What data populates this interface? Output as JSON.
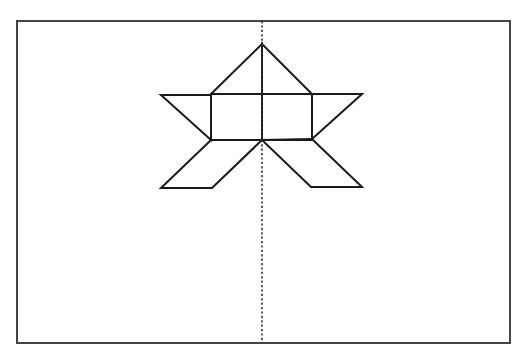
{
  "diagram": {
    "type": "tangram-symmetry-figure",
    "frame": {
      "x1": 17,
      "y1": 21,
      "x2": 510,
      "y2": 343,
      "stroke": "#444444"
    },
    "axis": {
      "x": 262,
      "y1": 21,
      "y2": 343,
      "style": "dotted",
      "stroke": "#333333"
    },
    "stroke_color": "#1a1a1a",
    "shapes": [
      {
        "name": "roof-left-triangle",
        "points": [
          [
            262,
            44
          ],
          [
            211,
            94
          ],
          [
            262,
            94
          ]
        ]
      },
      {
        "name": "roof-right-triangle",
        "points": [
          [
            262,
            44
          ],
          [
            312,
            94
          ],
          [
            262,
            94
          ]
        ]
      },
      {
        "name": "left-square",
        "points": [
          [
            211,
            94
          ],
          [
            262,
            94
          ],
          [
            262,
            140
          ],
          [
            211,
            140
          ]
        ]
      },
      {
        "name": "right-square",
        "points": [
          [
            262,
            94
          ],
          [
            312,
            94
          ],
          [
            312,
            140
          ],
          [
            262,
            140
          ]
        ]
      },
      {
        "name": "left-wing-triangle",
        "points": [
          [
            161,
            95
          ],
          [
            211,
            95
          ],
          [
            211,
            140
          ]
        ]
      },
      {
        "name": "right-wing-triangle",
        "points": [
          [
            312,
            94
          ],
          [
            362,
            94
          ],
          [
            312,
            139
          ]
        ]
      },
      {
        "name": "left-parallelogram",
        "points": [
          [
            211,
            140
          ],
          [
            262,
            140
          ],
          [
            212,
            188
          ],
          [
            161,
            188
          ]
        ]
      },
      {
        "name": "right-parallelogram",
        "points": [
          [
            262,
            140
          ],
          [
            312,
            139
          ],
          [
            362,
            187
          ],
          [
            311,
            187
          ]
        ]
      }
    ]
  }
}
